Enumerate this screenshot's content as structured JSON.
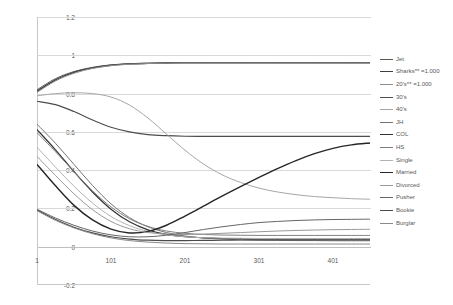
{
  "chart_data": {
    "type": "line",
    "title": "",
    "xlabel": "",
    "ylabel": "",
    "xlim": [
      1,
      451
    ],
    "ylim": [
      -0.2,
      1.2
    ],
    "yticks": [
      "1.2",
      "1",
      "0.8",
      "0.6",
      "0.4",
      "0.2",
      "0",
      "-0.2"
    ],
    "ytick_values": [
      1.2,
      1.0,
      0.8,
      0.6,
      0.4,
      0.2,
      0.0,
      -0.2
    ],
    "xticks": [
      "1",
      "101",
      "201",
      "301",
      "401"
    ],
    "xtick_values": [
      1,
      101,
      201,
      301,
      401
    ],
    "grid": true,
    "legend_position": "right",
    "x": [
      1,
      26,
      51,
      76,
      101,
      126,
      151,
      176,
      201,
      226,
      251,
      276,
      301,
      326,
      351,
      376,
      401,
      426,
      451
    ],
    "series": [
      {
        "name": "Jet",
        "color": "#595959",
        "width": 1.0,
        "values": [
          0.82,
          0.878,
          0.915,
          0.937,
          0.95,
          0.956,
          0.959,
          0.961,
          0.962,
          0.962,
          0.962,
          0.962,
          0.962,
          0.962,
          0.962,
          0.962,
          0.962,
          0.962,
          0.962
        ]
      },
      {
        "name": "Sharks** =1.000",
        "color": "#404040",
        "width": 1.4,
        "values": [
          0.812,
          0.872,
          0.911,
          0.934,
          0.948,
          0.955,
          0.958,
          0.96,
          0.961,
          0.961,
          0.961,
          0.961,
          0.961,
          0.961,
          0.961,
          0.961,
          0.961,
          0.961,
          0.961
        ]
      },
      {
        "name": "20's** =1.000",
        "color": "#8c8c8c",
        "width": 1.0,
        "values": [
          0.806,
          0.866,
          0.906,
          0.931,
          0.946,
          0.953,
          0.957,
          0.959,
          0.96,
          0.96,
          0.96,
          0.96,
          0.96,
          0.96,
          0.96,
          0.96,
          0.96,
          0.96,
          0.96
        ]
      },
      {
        "name": "30's",
        "color": "#4d4d4d",
        "width": 1.2,
        "values": [
          0.76,
          0.742,
          0.706,
          0.662,
          0.624,
          0.6,
          0.586,
          0.58,
          0.577,
          0.576,
          0.576,
          0.576,
          0.576,
          0.576,
          0.576,
          0.576,
          0.576,
          0.576,
          0.576
        ]
      },
      {
        "name": "40's",
        "color": "#a6a6a6",
        "width": 1.0,
        "values": [
          0.788,
          0.8,
          0.804,
          0.8,
          0.782,
          0.74,
          0.672,
          0.588,
          0.504,
          0.432,
          0.376,
          0.336,
          0.306,
          0.286,
          0.272,
          0.262,
          0.256,
          0.251,
          0.248
        ]
      },
      {
        "name": "JH",
        "color": "#737373",
        "width": 1.0,
        "values": [
          0.64,
          0.54,
          0.43,
          0.32,
          0.224,
          0.152,
          0.104,
          0.074,
          0.056,
          0.046,
          0.04,
          0.036,
          0.034,
          0.033,
          0.032,
          0.032,
          0.031,
          0.031,
          0.031
        ]
      },
      {
        "name": "COL",
        "color": "#333333",
        "width": 1.2,
        "values": [
          0.612,
          0.506,
          0.392,
          0.286,
          0.196,
          0.13,
          0.088,
          0.064,
          0.052,
          0.046,
          0.043,
          0.042,
          0.041,
          0.041,
          0.041,
          0.041,
          0.041,
          0.041,
          0.041
        ]
      },
      {
        "name": "HS",
        "color": "#808080",
        "width": 1.0,
        "values": [
          0.596,
          0.496,
          0.392,
          0.292,
          0.208,
          0.146,
          0.106,
          0.082,
          0.07,
          0.064,
          0.061,
          0.06,
          0.059,
          0.059,
          0.059,
          0.059,
          0.059,
          0.059,
          0.059
        ]
      },
      {
        "name": "Single",
        "color": "#b3b3b3",
        "width": 1.0,
        "values": [
          0.52,
          0.416,
          0.316,
          0.228,
          0.158,
          0.11,
          0.08,
          0.062,
          0.052,
          0.047,
          0.045,
          0.044,
          0.043,
          0.043,
          0.043,
          0.043,
          0.043,
          0.043,
          0.043
        ]
      },
      {
        "name": "Married",
        "color": "#262626",
        "width": 1.4,
        "values": [
          0.43,
          0.318,
          0.216,
          0.14,
          0.092,
          0.072,
          0.08,
          0.112,
          0.16,
          0.212,
          0.264,
          0.314,
          0.362,
          0.408,
          0.45,
          0.486,
          0.514,
          0.532,
          0.542
        ]
      },
      {
        "name": "Divorced",
        "color": "#999999",
        "width": 1.0,
        "values": [
          0.472,
          0.372,
          0.276,
          0.194,
          0.132,
          0.094,
          0.074,
          0.066,
          0.064,
          0.066,
          0.07,
          0.074,
          0.078,
          0.082,
          0.085,
          0.087,
          0.089,
          0.09,
          0.091
        ]
      },
      {
        "name": "Pusher",
        "color": "#666666",
        "width": 1.0,
        "values": [
          0.196,
          0.15,
          0.112,
          0.082,
          0.062,
          0.052,
          0.052,
          0.06,
          0.074,
          0.09,
          0.104,
          0.116,
          0.126,
          0.132,
          0.137,
          0.14,
          0.142,
          0.143,
          0.144
        ]
      },
      {
        "name": "Bookie",
        "color": "#4a4a4a",
        "width": 1.2,
        "values": [
          0.192,
          0.142,
          0.102,
          0.072,
          0.052,
          0.04,
          0.034,
          0.032,
          0.032,
          0.033,
          0.034,
          0.035,
          0.036,
          0.036,
          0.036,
          0.036,
          0.036,
          0.036,
          0.036
        ]
      },
      {
        "name": "Burglar",
        "color": "#8a8a8a",
        "width": 1.0,
        "values": [
          0.188,
          0.138,
          0.098,
          0.068,
          0.046,
          0.032,
          0.024,
          0.019,
          0.016,
          0.015,
          0.014,
          0.014,
          0.014,
          0.014,
          0.014,
          0.014,
          0.014,
          0.014,
          0.014
        ]
      }
    ]
  }
}
